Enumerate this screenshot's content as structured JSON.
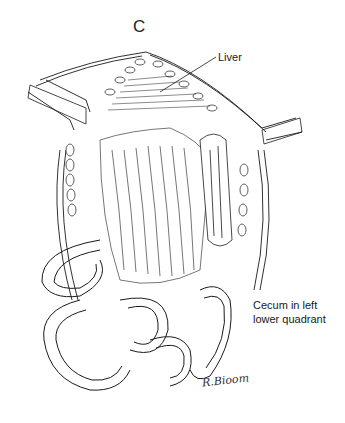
{
  "figure": {
    "panel_letter": "C",
    "labels": {
      "liver": "Liver",
      "cecum_line1": "Cecum in left",
      "cecum_line2": "lower quadrant"
    },
    "signature": "R.Bioom",
    "colors": {
      "ink": "#1a1a1a",
      "background": "#ffffff"
    }
  }
}
